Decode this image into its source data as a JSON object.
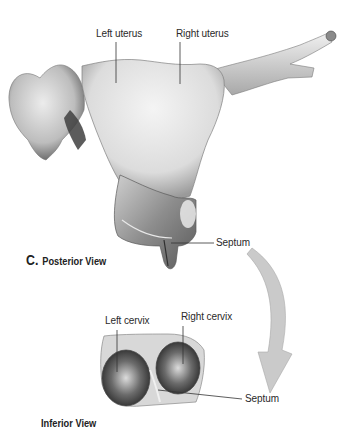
{
  "figure": {
    "panel_letter": "C.",
    "posterior_view": {
      "caption": "Posterior View",
      "labels": {
        "left_uterus": "Left uterus",
        "right_uterus": "Right uterus",
        "septum": "Septum"
      }
    },
    "inferior_view": {
      "caption": "Inferior View",
      "labels": {
        "left_cervix": "Left cervix",
        "right_cervix": "Right cervix",
        "septum": "Septum"
      }
    },
    "colors": {
      "tissue_light": "#e6e6e6",
      "tissue_mid": "#b8b8b8",
      "tissue_dark": "#555555",
      "arrow": "#c8c8c8",
      "leader_line": "#333333"
    }
  }
}
